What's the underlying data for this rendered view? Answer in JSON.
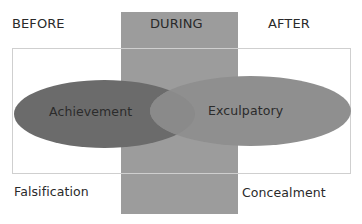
{
  "diagram": {
    "phases": [
      {
        "id": "before",
        "label": "BEFORE"
      },
      {
        "id": "during",
        "label": "DURING"
      },
      {
        "id": "after",
        "label": "AFTER"
      }
    ],
    "ellipses": [
      {
        "id": "achievement",
        "label": "Achievement",
        "color": "#6b6b6b"
      },
      {
        "id": "exculpatory",
        "label": "Exculpatory",
        "color": "#8f8f8f"
      }
    ],
    "corner_labels": {
      "bottom_left": "Falsification",
      "bottom_right": "Concealment"
    },
    "colors": {
      "during_column": "#9c9c9c",
      "frame_border": "#cfcfcf",
      "overlap": "#5f5f5f",
      "background": "#ffffff"
    }
  }
}
